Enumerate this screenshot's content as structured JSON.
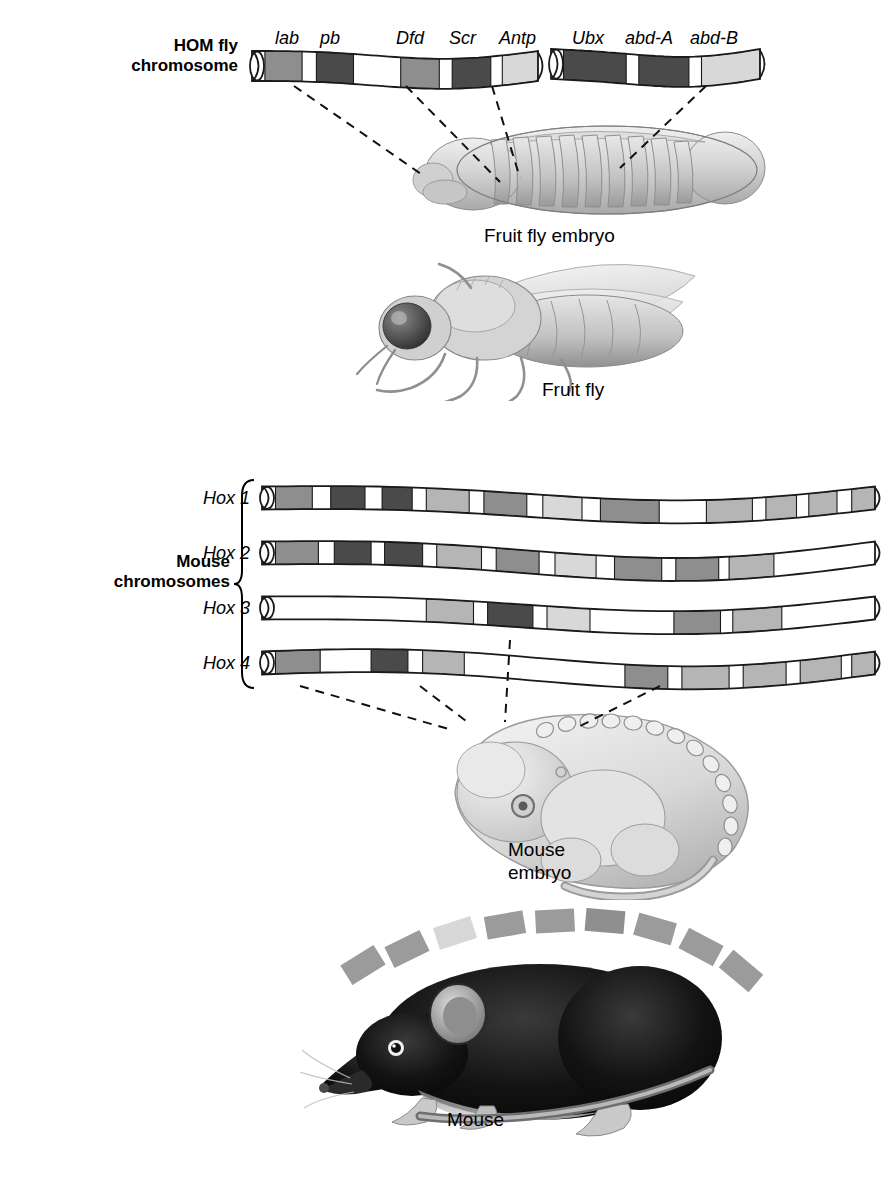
{
  "figure": {
    "type": "diagram"
  },
  "labels": {
    "hom_fly_chromosome": "HOM fly\nchromosome",
    "mouse_chromosomes": "Mouse\nchromosomes",
    "fruit_fly_embryo": "Fruit fly embryo",
    "fruit_fly": "Fruit fly",
    "mouse_embryo": "Mouse\nembryo",
    "mouse": "Mouse"
  },
  "fly_genes": [
    {
      "name": "lab",
      "x": 275
    },
    {
      "name": "pb",
      "x": 320
    },
    {
      "name": "Dfd",
      "x": 396
    },
    {
      "name": "Scr",
      "x": 449
    },
    {
      "name": "Antp",
      "x": 499
    },
    {
      "name": "Ubx",
      "x": 572
    },
    {
      "name": "abd-A",
      "x": 625
    },
    {
      "name": "abd-B",
      "x": 690
    }
  ],
  "hox_rows": [
    {
      "name": "Hox 1",
      "y": 498
    },
    {
      "name": "Hox 2",
      "y": 553
    },
    {
      "name": "Hox 3",
      "y": 608
    },
    {
      "name": "Hox 4",
      "y": 663
    }
  ],
  "chart_data": {
    "type": "diagram",
    "fly_chromosome_segments": [
      {
        "id": "ANT-C",
        "x0": 252,
        "x1": 538,
        "bands": [
          {
            "start": 0.0,
            "end": 0.045,
            "shade": "cap"
          },
          {
            "start": 0.045,
            "end": 0.175,
            "shade": "mid"
          },
          {
            "start": 0.175,
            "end": 0.225,
            "shade": "white"
          },
          {
            "start": 0.225,
            "end": 0.355,
            "shade": "dark"
          },
          {
            "start": 0.355,
            "end": 0.52,
            "shade": "white"
          },
          {
            "start": 0.52,
            "end": 0.655,
            "shade": "mid"
          },
          {
            "start": 0.655,
            "end": 0.7,
            "shade": "white"
          },
          {
            "start": 0.7,
            "end": 0.835,
            "shade": "dark"
          },
          {
            "start": 0.835,
            "end": 0.875,
            "shade": "white"
          },
          {
            "start": 0.875,
            "end": 1.0,
            "shade": "light"
          }
        ]
      },
      {
        "id": "BX-C",
        "x0": 551,
        "x1": 760,
        "bands": [
          {
            "start": 0.0,
            "end": 0.06,
            "shade": "cap"
          },
          {
            "start": 0.06,
            "end": 0.36,
            "shade": "dark"
          },
          {
            "start": 0.36,
            "end": 0.42,
            "shade": "white"
          },
          {
            "start": 0.42,
            "end": 0.66,
            "shade": "dark"
          },
          {
            "start": 0.66,
            "end": 0.72,
            "shade": "white"
          },
          {
            "start": 0.72,
            "end": 1.0,
            "shade": "light"
          }
        ]
      }
    ],
    "mouse_chromosomes": [
      {
        "id": "Hox 1",
        "x0": 262,
        "x1": 875,
        "bands": [
          {
            "start": 0.0,
            "end": 0.022,
            "shade": "cap"
          },
          {
            "start": 0.022,
            "end": 0.082,
            "shade": "mid"
          },
          {
            "start": 0.082,
            "end": 0.112,
            "shade": "white"
          },
          {
            "start": 0.112,
            "end": 0.168,
            "shade": "dark"
          },
          {
            "start": 0.168,
            "end": 0.196,
            "shade": "white"
          },
          {
            "start": 0.196,
            "end": 0.245,
            "shade": "dark"
          },
          {
            "start": 0.245,
            "end": 0.268,
            "shade": "white"
          },
          {
            "start": 0.268,
            "end": 0.338,
            "shade": "light2"
          },
          {
            "start": 0.338,
            "end": 0.362,
            "shade": "white"
          },
          {
            "start": 0.362,
            "end": 0.432,
            "shade": "mid"
          },
          {
            "start": 0.432,
            "end": 0.458,
            "shade": "white"
          },
          {
            "start": 0.458,
            "end": 0.522,
            "shade": "light"
          },
          {
            "start": 0.522,
            "end": 0.552,
            "shade": "white"
          },
          {
            "start": 0.552,
            "end": 0.648,
            "shade": "mid"
          },
          {
            "start": 0.648,
            "end": 0.725,
            "shade": "white"
          },
          {
            "start": 0.725,
            "end": 0.8,
            "shade": "light2"
          },
          {
            "start": 0.8,
            "end": 0.822,
            "shade": "white"
          },
          {
            "start": 0.822,
            "end": 0.872,
            "shade": "light2"
          },
          {
            "start": 0.872,
            "end": 0.892,
            "shade": "white"
          },
          {
            "start": 0.892,
            "end": 0.938,
            "shade": "light2"
          },
          {
            "start": 0.938,
            "end": 0.962,
            "shade": "white"
          },
          {
            "start": 0.962,
            "end": 1.0,
            "shade": "light2"
          }
        ]
      },
      {
        "id": "Hox 2",
        "x0": 262,
        "x1": 875,
        "bands": [
          {
            "start": 0.0,
            "end": 0.022,
            "shade": "cap"
          },
          {
            "start": 0.022,
            "end": 0.092,
            "shade": "mid"
          },
          {
            "start": 0.092,
            "end": 0.118,
            "shade": "white"
          },
          {
            "start": 0.118,
            "end": 0.178,
            "shade": "dark"
          },
          {
            "start": 0.178,
            "end": 0.2,
            "shade": "white"
          },
          {
            "start": 0.2,
            "end": 0.262,
            "shade": "dark"
          },
          {
            "start": 0.262,
            "end": 0.285,
            "shade": "white"
          },
          {
            "start": 0.285,
            "end": 0.358,
            "shade": "light2"
          },
          {
            "start": 0.358,
            "end": 0.382,
            "shade": "white"
          },
          {
            "start": 0.382,
            "end": 0.452,
            "shade": "mid"
          },
          {
            "start": 0.452,
            "end": 0.478,
            "shade": "white"
          },
          {
            "start": 0.478,
            "end": 0.545,
            "shade": "light"
          },
          {
            "start": 0.545,
            "end": 0.575,
            "shade": "white"
          },
          {
            "start": 0.575,
            "end": 0.652,
            "shade": "mid"
          },
          {
            "start": 0.652,
            "end": 0.675,
            "shade": "white"
          },
          {
            "start": 0.675,
            "end": 0.745,
            "shade": "mid"
          },
          {
            "start": 0.745,
            "end": 0.762,
            "shade": "white"
          },
          {
            "start": 0.762,
            "end": 0.835,
            "shade": "light2"
          },
          {
            "start": 0.835,
            "end": 1.0,
            "shade": "white"
          }
        ]
      },
      {
        "id": "Hox 3",
        "x0": 262,
        "x1": 875,
        "bands": [
          {
            "start": 0.0,
            "end": 0.022,
            "shade": "cap"
          },
          {
            "start": 0.022,
            "end": 0.268,
            "shade": "white"
          },
          {
            "start": 0.268,
            "end": 0.345,
            "shade": "light2"
          },
          {
            "start": 0.345,
            "end": 0.368,
            "shade": "white"
          },
          {
            "start": 0.368,
            "end": 0.442,
            "shade": "dark"
          },
          {
            "start": 0.442,
            "end": 0.465,
            "shade": "white"
          },
          {
            "start": 0.465,
            "end": 0.535,
            "shade": "light"
          },
          {
            "start": 0.535,
            "end": 0.672,
            "shade": "white"
          },
          {
            "start": 0.672,
            "end": 0.748,
            "shade": "mid"
          },
          {
            "start": 0.748,
            "end": 0.768,
            "shade": "white"
          },
          {
            "start": 0.768,
            "end": 0.848,
            "shade": "light2"
          },
          {
            "start": 0.848,
            "end": 1.0,
            "shade": "white"
          }
        ]
      },
      {
        "id": "Hox 4",
        "x0": 262,
        "x1": 875,
        "bands": [
          {
            "start": 0.0,
            "end": 0.022,
            "shade": "cap"
          },
          {
            "start": 0.022,
            "end": 0.095,
            "shade": "mid"
          },
          {
            "start": 0.095,
            "end": 0.178,
            "shade": "white"
          },
          {
            "start": 0.178,
            "end": 0.238,
            "shade": "dark"
          },
          {
            "start": 0.238,
            "end": 0.262,
            "shade": "white"
          },
          {
            "start": 0.262,
            "end": 0.33,
            "shade": "light2"
          },
          {
            "start": 0.33,
            "end": 0.592,
            "shade": "white"
          },
          {
            "start": 0.592,
            "end": 0.662,
            "shade": "mid"
          },
          {
            "start": 0.662,
            "end": 0.685,
            "shade": "white"
          },
          {
            "start": 0.685,
            "end": 0.762,
            "shade": "light2"
          },
          {
            "start": 0.762,
            "end": 0.785,
            "shade": "white"
          },
          {
            "start": 0.785,
            "end": 0.855,
            "shade": "light2"
          },
          {
            "start": 0.855,
            "end": 0.878,
            "shade": "white"
          },
          {
            "start": 0.878,
            "end": 0.945,
            "shade": "light2"
          },
          {
            "start": 0.945,
            "end": 0.962,
            "shade": "white"
          },
          {
            "start": 0.962,
            "end": 1.0,
            "shade": "light2"
          }
        ]
      }
    ],
    "mouse_somite_blocks": 9,
    "legend": [],
    "grid": false
  },
  "colors": {
    "dark": "#4a4a4a",
    "mid": "#8e8e8e",
    "light": "#d8d8d8",
    "light2": "#b5b5b5",
    "white": "#ffffff",
    "outline": "#1a1a1a",
    "body_fill": "#d9d9d9",
    "body_shade": "#b8b8b8",
    "mouse_body": "#141414"
  }
}
